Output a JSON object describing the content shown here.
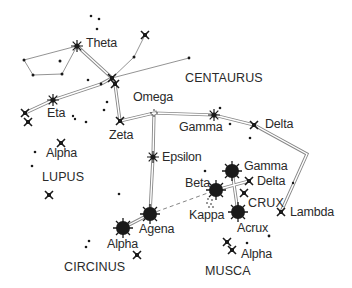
{
  "colors": {
    "ink": "#1a1a1a",
    "line": "#888888",
    "background": "#ffffff"
  },
  "constellations": [
    {
      "id": "centaurus",
      "label": "CENTAURUS",
      "x": 185,
      "y": 72
    },
    {
      "id": "lupus",
      "label": "LUPUS",
      "x": 42,
      "y": 171
    },
    {
      "id": "crux",
      "label": "CRUX",
      "x": 248,
      "y": 197
    },
    {
      "id": "circinus",
      "label": "CIRCINUS",
      "x": 64,
      "y": 261
    },
    {
      "id": "musca",
      "label": "MUSCA",
      "x": 205,
      "y": 265
    }
  ],
  "star_labels": [
    {
      "id": "theta",
      "label": "Theta",
      "x": 86,
      "y": 37
    },
    {
      "id": "eta",
      "label": "Eta",
      "x": 47,
      "y": 107
    },
    {
      "id": "omega",
      "label": "Omega",
      "x": 133,
      "y": 91
    },
    {
      "id": "zeta",
      "label": "Zeta",
      "x": 109,
      "y": 129
    },
    {
      "id": "gamma-cen",
      "label": "Gamma",
      "x": 179,
      "y": 121
    },
    {
      "id": "delta-cen",
      "label": "Delta",
      "x": 265,
      "y": 118
    },
    {
      "id": "epsilon",
      "label": "Epsilon",
      "x": 162,
      "y": 151
    },
    {
      "id": "alpha-lupus",
      "label": "Alpha",
      "x": 46,
      "y": 147
    },
    {
      "id": "beta-crux",
      "label": "Beta",
      "x": 185,
      "y": 177
    },
    {
      "id": "gamma-crux",
      "label": "Gamma",
      "x": 244,
      "y": 160
    },
    {
      "id": "delta-crux",
      "label": "Delta",
      "x": 257,
      "y": 175
    },
    {
      "id": "kappa",
      "label": "Kappa",
      "x": 189,
      "y": 209
    },
    {
      "id": "lambda",
      "label": "Lambda",
      "x": 290,
      "y": 206
    },
    {
      "id": "acrux",
      "label": "Acrux",
      "x": 237,
      "y": 222
    },
    {
      "id": "agena",
      "label": "Agena",
      "x": 139,
      "y": 223
    },
    {
      "id": "alpha-cen",
      "label": "Alpha",
      "x": 107,
      "y": 238
    },
    {
      "id": "alpha-musca",
      "label": "Alpha",
      "x": 241,
      "y": 248
    }
  ]
}
